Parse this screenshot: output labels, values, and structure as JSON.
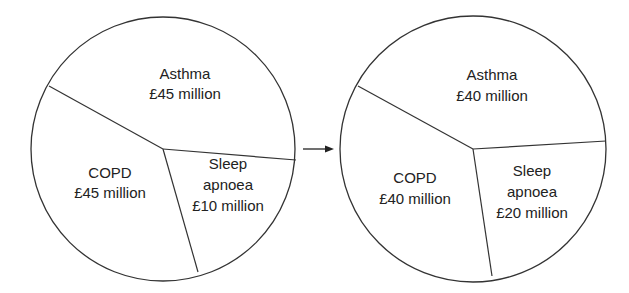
{
  "chart_data": [
    {
      "type": "pie",
      "title": "",
      "categories": [
        "Asthma",
        "COPD",
        "Sleep apnoea"
      ],
      "values": [
        45,
        45,
        10
      ],
      "unit": "£ million",
      "labels": [
        [
          "Asthma",
          "£45 million"
        ],
        [
          "COPD",
          "£45 million"
        ],
        [
          "Sleep",
          "apnoea",
          "£10 million"
        ]
      ],
      "legend": "none",
      "position": "left"
    },
    {
      "type": "pie",
      "title": "",
      "categories": [
        "Asthma",
        "COPD",
        "Sleep apnoea"
      ],
      "values": [
        40,
        40,
        20
      ],
      "unit": "£ million",
      "labels": [
        [
          "Asthma",
          "£40 million"
        ],
        [
          "COPD",
          "£40 million"
        ],
        [
          "Sleep",
          "apnoea",
          "£20 million"
        ]
      ],
      "legend": "none",
      "position": "right"
    }
  ],
  "transition": {
    "arrow": "right-arrow",
    "from": "left pie",
    "to": "right pie"
  },
  "colors": {
    "stroke": "#333333",
    "text": "#222222",
    "background": "#ffffff"
  },
  "layout": {
    "pies": [
      {
        "cx": 163,
        "cy": 149,
        "r": 132,
        "center": [
          163,
          149
        ],
        "spokes": [
          [
            49,
            86
          ],
          [
            296,
            160
          ],
          [
            198,
            272
          ]
        ],
        "label_pos": [
          {
            "x": 185,
            "y": [
              79,
              99
            ]
          },
          {
            "x": 110,
            "y": [
              178,
              198
            ]
          },
          {
            "x": 228,
            "y": [
              169,
              190,
              211
            ]
          }
        ]
      },
      {
        "cx": 473,
        "cy": 149,
        "r": 133,
        "center": [
          473,
          149
        ],
        "spokes": [
          [
            358,
            86
          ],
          [
            606,
            141
          ],
          [
            492,
            276
          ]
        ],
        "label_pos": [
          {
            "x": 492,
            "y": [
              80,
              101
            ]
          },
          {
            "x": 415,
            "y": [
              183,
              204
            ]
          },
          {
            "x": 532,
            "y": [
              176,
              197,
              218
            ]
          }
        ]
      }
    ],
    "arrow": {
      "x1": 303,
      "x2": 334,
      "y": 149
    }
  }
}
